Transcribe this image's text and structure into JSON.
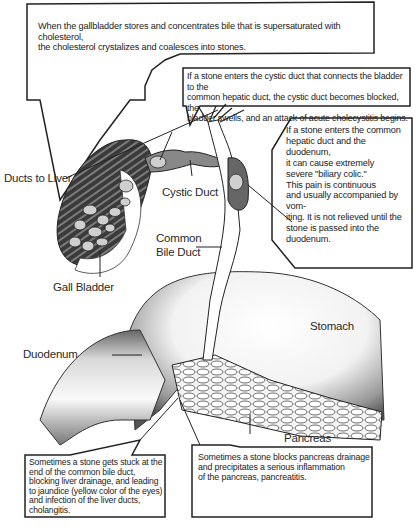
{
  "diagram": {
    "callouts": [
      {
        "id": "formation",
        "text_lines": [
          "When the gallbladder stores and concentrates bile that is supersaturated with cholesterol,",
          "the cholesterol crystalizes and coalesces into stones."
        ]
      },
      {
        "id": "cystic-duct-stone",
        "text_lines": [
          "If a stone enters the cystic duct that connects the bladder to the",
          "common hepatic duct, the cystic duct becomes blocked, the",
          "bladder swells, and an attack of acute cholecystitis begins."
        ]
      },
      {
        "id": "hepatic-duct-stone",
        "text_lines": [
          "If a stone enters the common",
          "hepatic duct and the duodenum,",
          "it can cause extremely",
          "severe \"biliary colic.\"",
          "This pain is continuous",
          "and usually accompanied by vom-",
          "iting. It is not relieved until the",
          "stone is passed into the",
          "duodenum."
        ]
      },
      {
        "id": "bile-duct-stone",
        "text_lines": [
          "Sometimes a stone gets stuck at the",
          "end of the common bile duct,",
          "blocking liver drainage, and leading",
          "to jaundice (yellow color of the eyes)",
          "and infection of the liver ducts,",
          "cholangitis."
        ]
      },
      {
        "id": "pancreas-stone",
        "text_lines": [
          "Sometimes a stone  blocks pancreas drainage",
          "and precipitates a serious inflammation",
          "of the pancreas, pancreatitis."
        ]
      }
    ],
    "labels": {
      "ducts_to_liver": "Ducts to Liver",
      "cystic_duct": "Cystic Duct",
      "common_bile_duct_1": "Common",
      "common_bile_duct_2": "Bile Duct",
      "gall_bladder": "Gall Bladder",
      "stomach": "Stomach",
      "duodenum": "Duodenum",
      "pancreas": "Pancreas"
    },
    "colors": {
      "ink": "#222222",
      "background": "#ffffff",
      "shade_dark": "#555555",
      "shade_light": "#bdbdbd",
      "stone_fill": "#cfcfcf"
    }
  }
}
